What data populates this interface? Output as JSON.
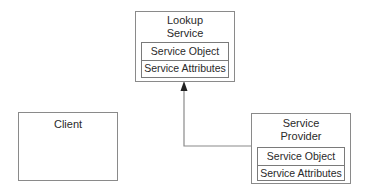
{
  "diagram": {
    "lookup_service": {
      "title_line1": "Lookup",
      "title_line2": "Service",
      "rows": [
        "Service Object",
        "Service Attributes"
      ]
    },
    "client": {
      "title": "Client"
    },
    "service_provider": {
      "title_line1": "Service",
      "title_line2": "Provider",
      "rows": [
        "Service Object",
        "Service Attributes"
      ]
    },
    "connections": [
      {
        "from": "service_provider",
        "to": "lookup_service",
        "style": "elbow-arrow"
      }
    ],
    "colors": {
      "line": "#8a8a8a",
      "text": "#2a2a2a",
      "background": "#ffffff"
    }
  }
}
